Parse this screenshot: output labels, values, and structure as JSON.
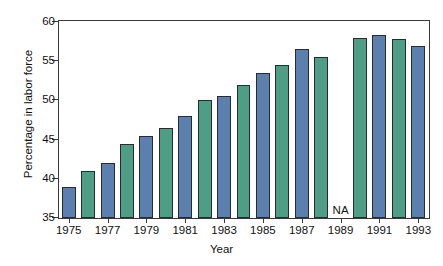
{
  "chart_data": {
    "type": "bar",
    "title": "",
    "xlabel": "Year",
    "ylabel": "Percentage in labor force",
    "ylim": [
      35,
      60
    ],
    "yticks": [
      35,
      40,
      45,
      50,
      55,
      60
    ],
    "xticks": [
      "1975",
      "1977",
      "1979",
      "1981",
      "1983",
      "1985",
      "1987",
      "1989",
      "1991",
      "1993"
    ],
    "grid": false,
    "legend": "none",
    "missing_label": "NA",
    "categories": [
      "1975",
      "1976",
      "1977",
      "1978",
      "1979",
      "1980",
      "1981",
      "1982",
      "1983",
      "1984",
      "1985",
      "1986",
      "1987",
      "1988",
      "1989",
      "1990",
      "1991",
      "1992",
      "1993"
    ],
    "values": [
      39.0,
      41.0,
      42.0,
      44.5,
      45.5,
      46.5,
      48.0,
      50.0,
      50.5,
      52.0,
      53.5,
      54.5,
      56.5,
      55.5,
      null,
      58.0,
      58.3,
      57.8,
      57.0
    ],
    "bar_colors": [
      "blue",
      "green",
      "blue",
      "green",
      "blue",
      "green",
      "blue",
      "green",
      "blue",
      "green",
      "blue",
      "green",
      "blue",
      "green",
      null,
      "green",
      "blue",
      "green",
      "blue"
    ],
    "colors": {
      "blue": "#5b7fae",
      "green": "#4e9e86",
      "axis": "#3a3a3a",
      "text": "#111111",
      "background": "#ffffff"
    }
  }
}
